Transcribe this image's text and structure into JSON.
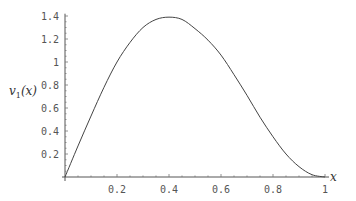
{
  "chart_data": {
    "type": "line",
    "title": "",
    "xlabel": "x",
    "ylabel": "v1(x)",
    "xlim": [
      0,
      1
    ],
    "ylim": [
      0,
      1.4
    ],
    "grid": false,
    "legend": null,
    "x_ticks": [
      "0.2",
      "0.4",
      "0.6",
      "0.8",
      "1"
    ],
    "y_ticks": [
      "0.2",
      "0.4",
      "0.6",
      "0.8",
      "1",
      "1.2",
      "1.4"
    ],
    "series": [
      {
        "name": "v1(x)",
        "x": [
          0,
          0.05,
          0.1,
          0.15,
          0.2,
          0.25,
          0.3,
          0.35,
          0.4,
          0.45,
          0.5,
          0.55,
          0.6,
          0.65,
          0.7,
          0.75,
          0.8,
          0.85,
          0.9,
          0.95,
          1.0
        ],
        "values": [
          0,
          0.27,
          0.53,
          0.78,
          1.0,
          1.17,
          1.3,
          1.37,
          1.39,
          1.37,
          1.29,
          1.19,
          1.06,
          0.89,
          0.71,
          0.52,
          0.35,
          0.2,
          0.09,
          0.02,
          0
        ]
      }
    ]
  },
  "axes": {
    "x_label": "x",
    "y_label_main": "v",
    "y_label_sub": "1",
    "y_label_arg": "(x)"
  }
}
